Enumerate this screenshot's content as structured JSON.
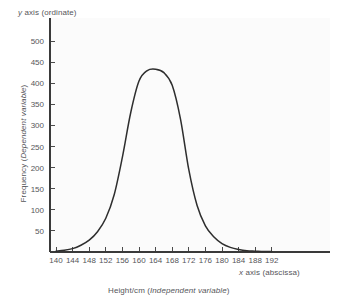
{
  "chart_data": {
    "type": "line",
    "title": "",
    "subtitle": "",
    "xlabel": "Height/cm (Independent variable)",
    "ylabel": "Frequency (Dependent variable)",
    "xlim": [
      140,
      194
    ],
    "ylim": [
      0,
      520
    ],
    "grid": false,
    "legend": null,
    "x_ticks": [
      140,
      144,
      148,
      152,
      156,
      160,
      164,
      168,
      172,
      176,
      180,
      184,
      188,
      192
    ],
    "y_ticks": [
      50,
      100,
      150,
      200,
      250,
      300,
      350,
      400,
      450,
      500
    ],
    "annotations": {
      "y_axis_note_plain": " axis (ordinate)",
      "y_axis_note_italic": "y",
      "x_axis_note_plain": " axis (abscissa)",
      "x_axis_note_italic": "x",
      "x_title_plain": "Height/cm (",
      "x_title_italic": "Independent variable",
      "x_title_tail": ")",
      "y_title_plain": "Frequency (",
      "y_title_italic": "Dependent variable",
      "y_title_tail": ")"
    },
    "series": [
      {
        "name": "Height frequency distribution",
        "x": [
          140,
          142,
          144,
          146,
          148,
          150,
          152,
          154,
          156,
          158,
          160,
          162,
          164,
          166,
          168,
          170,
          172,
          174,
          176,
          178,
          180,
          182,
          184,
          186,
          188,
          190,
          192
        ],
        "values": [
          2,
          4,
          8,
          16,
          28,
          48,
          80,
          135,
          225,
          330,
          405,
          430,
          433,
          425,
          395,
          315,
          195,
          110,
          62,
          36,
          20,
          11,
          6,
          3,
          2,
          1,
          1
        ],
        "peak_value": 433,
        "peak_x": 164
      }
    ],
    "colors": {
      "curve": "#2e2e2e",
      "axis": "#3a3a3a",
      "text": "#56565a",
      "plot_background": "#fbfbfb",
      "page_background": "#ffffff"
    }
  }
}
